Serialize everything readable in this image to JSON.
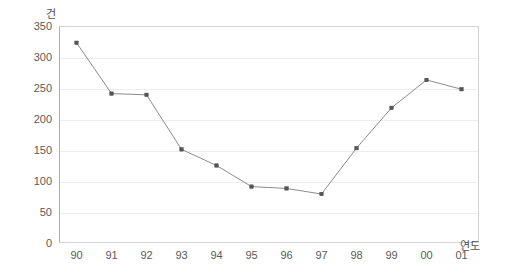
{
  "chart_data": {
    "type": "line",
    "title": "",
    "xlabel": "연도",
    "ylabel": "건",
    "categories": [
      "90",
      "91",
      "92",
      "93",
      "94",
      "95",
      "96",
      "97",
      "98",
      "99",
      "00",
      "01"
    ],
    "values": [
      323,
      241,
      239,
      151,
      125,
      91,
      88,
      79,
      153,
      218,
      263,
      248
    ],
    "series": [
      {
        "name": "건수",
        "values": [
          323,
          241,
          239,
          151,
          125,
          91,
          88,
          79,
          153,
          218,
          263,
          248
        ]
      }
    ],
    "ylim": [
      0,
      350
    ],
    "ytick_values": [
      0,
      50,
      100,
      150,
      200,
      250,
      300,
      350
    ],
    "ytick_labels": [
      "0",
      "50",
      "100",
      "150",
      "200",
      "250",
      "300",
      "350"
    ],
    "xtick_labels": [
      "90",
      "91",
      "92",
      "93",
      "94",
      "95",
      "96",
      "97",
      "98",
      "99",
      "00",
      "01"
    ],
    "grid": "horizontal",
    "legend": "none",
    "marker": "square",
    "line_color": "#8c8c8c",
    "marker_color": "#555555",
    "grid_color": "#ededed",
    "axis_color": "#b0b0b0",
    "text_color": "#5a5a5a",
    "background_color": "#ffffff"
  }
}
